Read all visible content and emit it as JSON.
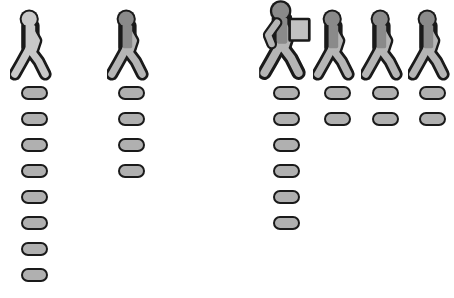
{
  "chart_data": {
    "type": "bar",
    "title": "",
    "subtitle": "",
    "xlabel": "",
    "ylabel": "",
    "categories": [
      "1",
      "2",
      "3",
      "4",
      "5",
      "6"
    ],
    "values": [
      8,
      4,
      6,
      2,
      2,
      2
    ],
    "unit_label": "pill",
    "unit_value": 1,
    "grid": false,
    "legend": "none",
    "orientation": "vertical-stack"
  },
  "canvas": {
    "width": 442,
    "height": 298,
    "background": "#ffffff"
  },
  "palette": {
    "outline": "#1a1a1a",
    "pill_fill": "#b0b0b0",
    "figure_light": "#c9c9c9",
    "figure_light_limb": "#c9c9c9",
    "figure_dark_head": "#8a8a8a",
    "figure_dark_torso": "#8a8a8a",
    "figure_dark_limb": "#b5b5b5",
    "carried_item_fill": "#c2c2c2"
  },
  "columns": [
    {
      "id": "column-1",
      "x": 10,
      "count": 8,
      "figure": {
        "name": "walking-person-icon",
        "style": "light",
        "scale": 1.0,
        "carrying": false,
        "carried_item": ""
      }
    },
    {
      "id": "column-2",
      "x": 107,
      "count": 4,
      "figure": {
        "name": "walking-person-icon",
        "style": "dark",
        "scale": 1.0,
        "carrying": false,
        "carried_item": ""
      }
    },
    {
      "id": "column-3",
      "x": 262,
      "count": 6,
      "figure": {
        "name": "walking-person-carrying-box-icon",
        "style": "dark",
        "scale": 1.12,
        "carrying": true,
        "carried_item": "box"
      }
    },
    {
      "id": "column-4",
      "x": 313,
      "count": 2,
      "figure": {
        "name": "walking-person-icon",
        "style": "dark",
        "scale": 1.0,
        "carrying": false,
        "carried_item": ""
      }
    },
    {
      "id": "column-5",
      "x": 361,
      "count": 2,
      "figure": {
        "name": "walking-person-icon",
        "style": "dark",
        "scale": 1.0,
        "carrying": false,
        "carried_item": ""
      }
    },
    {
      "id": "column-6",
      "x": 408,
      "count": 2,
      "figure": {
        "name": "walking-person-icon",
        "style": "dark",
        "scale": 1.0,
        "carrying": false,
        "carried_item": ""
      }
    }
  ]
}
